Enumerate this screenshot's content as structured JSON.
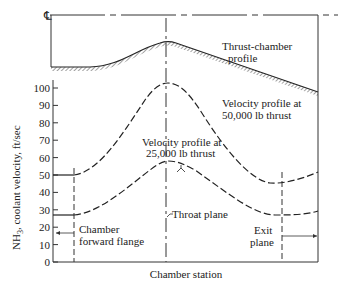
{
  "chart_data": {
    "type": "line",
    "title": "",
    "xlabel": "Chamber station",
    "ylabel": "NH3, coolant velocity, ft/sec",
    "ylim": [
      0,
      105
    ],
    "yticks": [
      0,
      10,
      20,
      30,
      40,
      50,
      60,
      70,
      80,
      90,
      100
    ],
    "centerline_symbol": "℄",
    "series": [
      {
        "name": "Velocity profile at 50,000 lb thrust",
        "x_station": [
          "start",
          "chamber forward flange",
          "throat plane",
          "exit plane",
          "end"
        ],
        "values": [
          49,
          49,
          103,
          45,
          52
        ]
      },
      {
        "name": "Velocity profile at 25,000 lb thrust",
        "x_station": [
          "start",
          "chamber forward flange",
          "throat plane",
          "exit plane",
          "end"
        ],
        "values": [
          27,
          27,
          58,
          27,
          29
        ]
      }
    ],
    "annotations": [
      "Thrust-chamber profile",
      "Velocity profile at 50,000 lb thrust",
      "Velocity profile at 25,000 lb thrust",
      "Chamber forward flange",
      "Throat plane",
      "Exit plane"
    ],
    "grid": false,
    "legend": "none (inline labels)"
  },
  "labels": {
    "centerline": "℄",
    "thrust_profile_1": "Thrust-chamber",
    "thrust_profile_2": "profile",
    "v50_1": "Velocity profile at",
    "v50_2": "50,000 lb thrust",
    "v25_1": "Velocity profile at",
    "v25_2": "25,000 lb thrust",
    "flange_1": "Chamber",
    "flange_2": "forward flange",
    "throat": "Throat plane",
    "exit_1": "Exit",
    "exit_2": "plane",
    "xlabel": "Chamber station",
    "ylabel_main": "NH",
    "ylabel_sub": "3",
    "ylabel_rest": ", coolant velocity, ft/sec"
  },
  "ticks": [
    "0",
    "10",
    "20",
    "30",
    "40",
    "50",
    "60",
    "70",
    "80",
    "90",
    "100"
  ]
}
